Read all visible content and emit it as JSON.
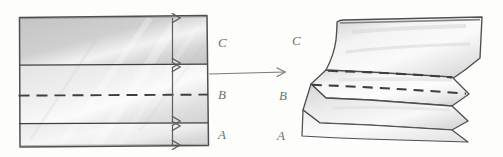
{
  "figure": {
    "medium": "pencil sketch on white paper",
    "background_color": "#fdfdfc",
    "ink_color": "#5a5a5a",
    "shading_color": "#c9c9c9"
  },
  "left_diagram": {
    "name": "flat-layered-block",
    "description": "Rectangular block divided by horizontal lines into three layers with a central dashed marker line and vertical double-headed dimension arrows",
    "labels": [
      {
        "id": "label-c-left",
        "text": "C"
      },
      {
        "id": "label-b-left",
        "text": "B"
      },
      {
        "id": "label-a-left",
        "text": "A"
      }
    ],
    "layers": [
      {
        "id": "layer-c",
        "label": "C"
      },
      {
        "id": "layer-b",
        "label": "B"
      },
      {
        "id": "layer-a",
        "label": "A"
      }
    ],
    "dashed_line": {
      "id": "marker-dashed-line",
      "style": "dashed"
    },
    "dimension_arrows": [
      {
        "id": "dimension-arrow-c",
        "orientation": "vertical",
        "heads": "double"
      },
      {
        "id": "dimension-arrow-b",
        "orientation": "vertical",
        "heads": "double"
      },
      {
        "id": "dimension-arrow-a",
        "orientation": "vertical",
        "heads": "double"
      }
    ]
  },
  "transition": {
    "name": "transition-arrow",
    "direction": "right",
    "text": ""
  },
  "right_diagram": {
    "name": "folded-layered-block",
    "description": "Same block after folding: layers bow into chevron/zigzag profile with pointed left and right edges",
    "labels": [
      {
        "id": "label-c-right",
        "text": "C"
      },
      {
        "id": "label-b-right",
        "text": "B"
      },
      {
        "id": "label-a-right",
        "text": "A"
      }
    ],
    "layers": [
      {
        "id": "folded-layer-c",
        "label": "C"
      },
      {
        "id": "folded-layer-b",
        "label": "B"
      },
      {
        "id": "folded-layer-a",
        "label": "A"
      }
    ],
    "dashed_lines": [
      {
        "id": "folded-dashed-upper",
        "style": "dashed"
      },
      {
        "id": "folded-dashed-lower",
        "style": "dashed"
      }
    ]
  }
}
